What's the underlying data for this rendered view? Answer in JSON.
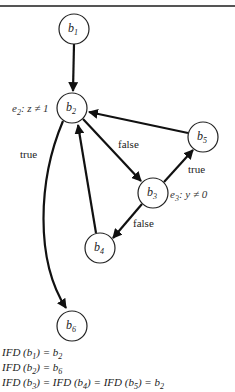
{
  "diagram": {
    "type": "control-flow-graph",
    "nodes": [
      {
        "id": "b1",
        "base": "b",
        "sub": "1",
        "cx": 74,
        "cy": 29
      },
      {
        "id": "b2",
        "base": "b",
        "sub": "2",
        "cx": 72,
        "cy": 108
      },
      {
        "id": "b3",
        "base": "b",
        "sub": "3",
        "cx": 153,
        "cy": 193
      },
      {
        "id": "b4",
        "base": "b",
        "sub": "4",
        "cx": 100,
        "cy": 248
      },
      {
        "id": "b5",
        "base": "b",
        "sub": "5",
        "cx": 203,
        "cy": 137
      },
      {
        "id": "b6",
        "base": "b",
        "sub": "6",
        "cx": 72,
        "cy": 326
      }
    ],
    "edges": [
      {
        "from": "b1",
        "to": "b2",
        "label": ""
      },
      {
        "from": "b2",
        "to": "b3",
        "label": "false"
      },
      {
        "from": "b2",
        "to": "b6",
        "label": "true"
      },
      {
        "from": "b3",
        "to": "b5",
        "label": "true"
      },
      {
        "from": "b3",
        "to": "b4",
        "label": "false"
      },
      {
        "from": "b4",
        "to": "b2",
        "label": ""
      },
      {
        "from": "b5",
        "to": "b2",
        "label": ""
      }
    ],
    "conditions": {
      "e2": {
        "prefix": "e",
        "sub": "2",
        "text": ": z ≠ 1"
      },
      "e3": {
        "prefix": "e",
        "sub": "3",
        "text": ": y ≠ 0"
      }
    },
    "edge_labels": {
      "b2_b3": "false",
      "b2_b6": "true",
      "b3_b5": "true",
      "b3_b4": "false"
    }
  },
  "ifd": {
    "line1": {
      "fn": "IFD",
      "arg_sub": "1",
      "result_sub": "2"
    },
    "line2": {
      "fn": "IFD",
      "arg_sub": "2",
      "result_sub": "6"
    },
    "line3": {
      "fn": "IFD",
      "args": [
        "3",
        "4",
        "5"
      ],
      "result_sub": "2"
    }
  }
}
